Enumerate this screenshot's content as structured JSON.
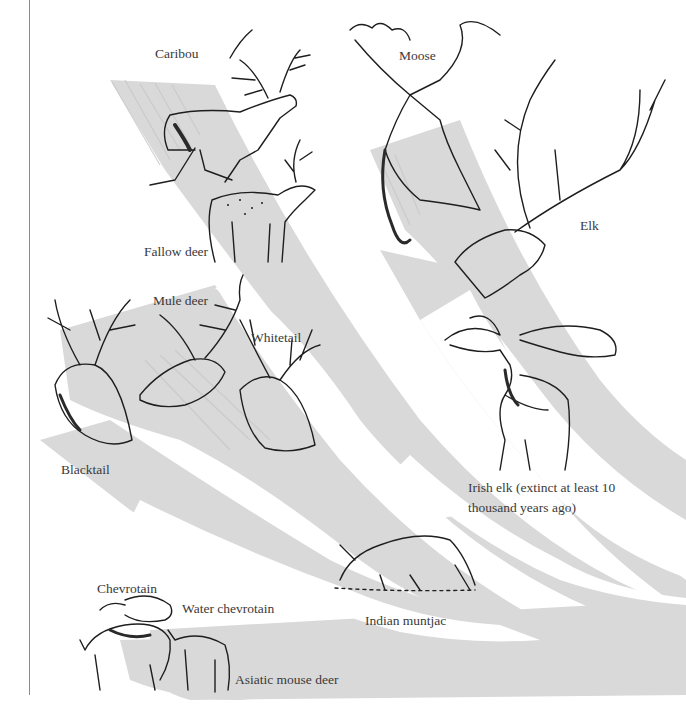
{
  "diagram": {
    "type": "phylogeny-illustration",
    "colors": {
      "band": "#d9d9d9",
      "band_streak": "#c8c8c8",
      "ink": "#1e1e1e",
      "label": "#3a3a3a",
      "rule": "#8a8a8a"
    },
    "labels": {
      "caribou": "Caribou",
      "moose": "Moose",
      "fallow_deer": "Fallow deer",
      "elk": "Elk",
      "mule_deer": "Mule deer",
      "whitetail": "Whitetail",
      "blacktail": "Blacktail",
      "irish_elk_line1": "Irish elk (extinct at least 10",
      "irish_elk_line2": "thousand years ago)",
      "indian_muntjac": "Indian muntjac",
      "chevrotain": "Chevrotain",
      "water_chevrotain": "Water chevrotain",
      "asiatic_mouse_deer": "Asiatic mouse deer"
    },
    "species": [
      {
        "name": "Caribou",
        "illustration": "full-body-running"
      },
      {
        "name": "Moose",
        "illustration": "head"
      },
      {
        "name": "Fallow deer",
        "illustration": "full-body-standing"
      },
      {
        "name": "Elk",
        "illustration": "head"
      },
      {
        "name": "Mule deer",
        "illustration": "head"
      },
      {
        "name": "Whitetail",
        "illustration": "head"
      },
      {
        "name": "Blacktail",
        "illustration": "head"
      },
      {
        "name": "Irish elk",
        "illustration": "full-body-standing",
        "note": "extinct at least 10 thousand years ago"
      },
      {
        "name": "Indian muntjac",
        "illustration": "full-body-grazing"
      },
      {
        "name": "Chevrotain",
        "illustration": "full-body"
      },
      {
        "name": "Water chevrotain",
        "illustration": "full-body"
      },
      {
        "name": "Asiatic mouse deer",
        "illustration": "full-body"
      }
    ]
  }
}
